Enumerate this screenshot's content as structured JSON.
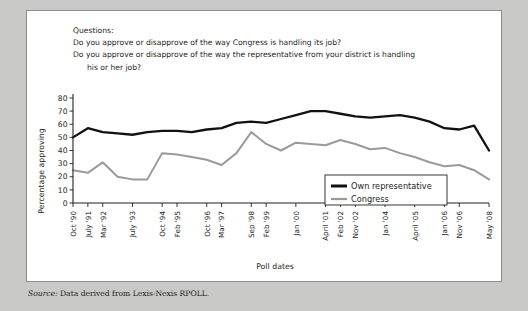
{
  "questions": {
    "heading": "Questions:",
    "q1": "Do you approve or disapprove of the way Congress is handling its job?",
    "q2a": "Do you approve or disapprove of the way the representative from your district is handling",
    "q2b": "his or her job?"
  },
  "source": {
    "label": "Source:",
    "text": "Data derived from Lexis-Nexis RPOLL."
  },
  "chart_data": {
    "type": "line",
    "title": "",
    "xlabel": "Poll dates",
    "ylabel": "Percentage approving",
    "ylim": [
      0,
      80
    ],
    "yticks": [
      0,
      10,
      20,
      30,
      40,
      50,
      60,
      70,
      80
    ],
    "grid": false,
    "legend_position": "inside-right",
    "categories": [
      "Oct '90",
      "July '91",
      "Mar '92",
      "",
      "July '93",
      "",
      "Oct '94",
      "Feb '95",
      "",
      "Oct '96",
      "Mar '97",
      "",
      "Sep '98",
      "Feb '99",
      "",
      "Jan '00",
      "",
      "April '01",
      "Feb '02",
      "Nov '02",
      "",
      "Jan '04",
      "",
      "April '05",
      "",
      "Jan '06",
      "Nov '06",
      "",
      "May '08"
    ],
    "xtick_labels": [
      "Oct '90",
      "July '91",
      "Mar '92",
      "July '93",
      "Oct '94",
      "Feb '95",
      "Oct '96",
      "Mar '97",
      "Sep '98",
      "Feb '99",
      "Jan '00",
      "April '01",
      "Feb '02",
      "Nov '02",
      "Jan '04",
      "April '05",
      "Jan '06",
      "Nov '06",
      "May '08"
    ],
    "series": [
      {
        "name": "Own representative",
        "color": "#111111",
        "values": [
          50,
          57,
          54,
          53,
          52,
          54,
          55,
          55,
          54,
          56,
          57,
          61,
          62,
          61,
          64,
          67,
          70,
          70,
          68,
          66,
          65,
          66,
          67,
          65,
          62,
          57,
          56,
          59,
          40
        ]
      },
      {
        "name": "Congress",
        "color": "#9a9a9a",
        "values": [
          25,
          23,
          31,
          20,
          18,
          18,
          38,
          37,
          35,
          33,
          29,
          38,
          54,
          45,
          40,
          46,
          45,
          44,
          48,
          45,
          41,
          42,
          38,
          35,
          31,
          28,
          29,
          25,
          18
        ]
      }
    ]
  }
}
